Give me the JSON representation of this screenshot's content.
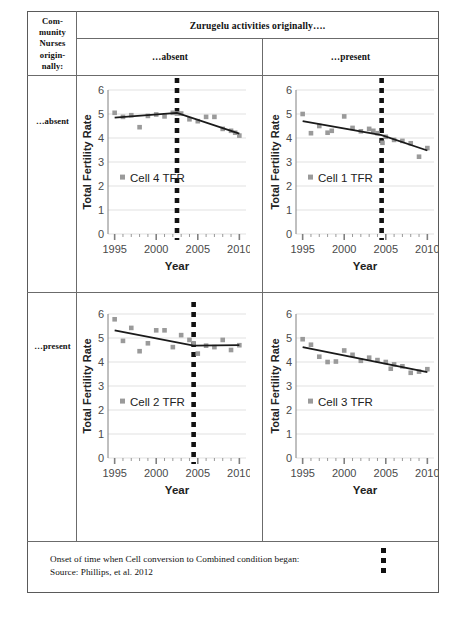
{
  "figure": {
    "corner_label": "Com-\nmunity\nNurses\norigin-\nnally:",
    "column_header": "Zurugelu activities originally….",
    "column_sub_absent": "…absent",
    "column_sub_present": "…present",
    "row_label_absent": "…absent",
    "row_label_present": "…present",
    "footer_legend": "Onset of time when Cell conversion to Combined condition began:",
    "footer_source": "Source: Phillips, et al. 2012",
    "marker_color": "#9a9a9a",
    "trend_color": "#1a1a1a",
    "dash_color": "#111111",
    "grid_color": "#d9d9d9",
    "axis_color": "#808080",
    "border_color": "#5a5a5a"
  },
  "chart_data": [
    {
      "type": "scatter",
      "panel": "top-left",
      "title": "Cell 4 TFR",
      "legend": [
        "Cell 4 TFR"
      ],
      "legend_position": "inside-left",
      "xlabel": "Year",
      "ylabel": "Total Fertility Rate",
      "xlim": [
        1994.2,
        2010.8
      ],
      "ylim": [
        0,
        6
      ],
      "yticks": [
        0,
        1,
        2,
        3,
        4,
        5,
        6
      ],
      "xticks": [
        1995,
        2000,
        2005,
        2010
      ],
      "grid": true,
      "x": [
        1995,
        1996,
        1997,
        1998,
        1999,
        2000,
        2001,
        2002,
        2002.5,
        2003,
        2004,
        2005,
        2006,
        2007,
        2008,
        2009,
        2009.5,
        2010
      ],
      "values": [
        5.05,
        4.88,
        4.95,
        4.45,
        4.92,
        4.98,
        4.9,
        5.05,
        5.02,
        5.02,
        4.78,
        4.7,
        4.88,
        4.88,
        4.38,
        4.3,
        4.22,
        4.1
      ],
      "trend_x": [
        1995,
        2002.5,
        2010
      ],
      "trend_y": [
        4.85,
        5.05,
        4.18
      ],
      "vline_x": 2002.5,
      "vline_label": "Onset of Cell conversion"
    },
    {
      "type": "scatter",
      "panel": "top-right",
      "title": "Cell 1 TFR",
      "legend": [
        "Cell 1 TFR"
      ],
      "legend_position": "inside-left",
      "xlabel": "Year",
      "ylabel": "Total Fertility Rate",
      "xlim": [
        1994.2,
        2010.8
      ],
      "ylim": [
        0,
        6
      ],
      "yticks": [
        0,
        1,
        2,
        3,
        4,
        5,
        6
      ],
      "xticks": [
        1995,
        2000,
        2005,
        2010
      ],
      "grid": true,
      "x": [
        1995,
        1996,
        1997,
        1998,
        1998.5,
        2000,
        2001,
        2002,
        2003,
        2003.5,
        2004,
        2004.6,
        2005,
        2006,
        2007,
        2008,
        2009,
        2010
      ],
      "values": [
        5.0,
        4.2,
        4.5,
        4.22,
        4.3,
        4.9,
        4.42,
        4.28,
        4.38,
        4.3,
        4.2,
        3.8,
        4.05,
        3.92,
        3.88,
        3.78,
        3.22,
        3.58
      ],
      "trend_x": [
        1995,
        2004.5,
        2010
      ],
      "trend_y": [
        4.7,
        4.12,
        3.48
      ],
      "vline_x": 2004.5,
      "vline_label": "Onset of Cell conversion"
    },
    {
      "type": "scatter",
      "panel": "bottom-left",
      "title": "Cell 2 TFR",
      "legend": [
        "Cell 2 TFR"
      ],
      "legend_position": "inside-left",
      "xlabel": "Year",
      "ylabel": "Total Fertility Rate",
      "xlim": [
        1994.2,
        2010.8
      ],
      "ylim": [
        0,
        6
      ],
      "yticks": [
        0,
        1,
        2,
        3,
        4,
        5,
        6
      ],
      "xticks": [
        1995,
        2000,
        2005,
        2010
      ],
      "grid": true,
      "x": [
        1995,
        1996,
        1997,
        1998,
        1999,
        2000,
        2001,
        2002,
        2003,
        2004,
        2004.5,
        2005,
        2006,
        2007,
        2008,
        2009,
        2010
      ],
      "values": [
        5.78,
        4.88,
        5.42,
        4.45,
        4.78,
        5.32,
        5.32,
        4.62,
        5.12,
        4.92,
        4.78,
        4.35,
        4.68,
        4.62,
        4.92,
        4.5,
        4.7
      ],
      "trend_x": [
        1995,
        2004.5,
        2010
      ],
      "trend_y": [
        5.32,
        4.68,
        4.7
      ],
      "vline_x": 2004.5,
      "vline_label": "Onset of Cell conversion"
    },
    {
      "type": "scatter",
      "panel": "bottom-right",
      "title": "Cell 3 TFR",
      "legend": [
        "Cell 3 TFR"
      ],
      "legend_position": "inside-left",
      "xlabel": "Year",
      "ylabel": "Total Fertility Rate",
      "xlim": [
        1994.2,
        2010.8
      ],
      "ylim": [
        0,
        6
      ],
      "yticks": [
        0,
        1,
        2,
        3,
        4,
        5,
        6
      ],
      "xticks": [
        1995,
        2000,
        2005,
        2010
      ],
      "grid": true,
      "x": [
        1995,
        1996,
        1997,
        1998,
        1999,
        2000,
        2001,
        2002,
        2003,
        2004,
        2005,
        2005.6,
        2006,
        2007,
        2008,
        2009,
        2010
      ],
      "values": [
        4.95,
        4.72,
        4.22,
        4.0,
        4.02,
        4.48,
        4.3,
        4.05,
        4.18,
        4.08,
        4.0,
        3.72,
        3.9,
        3.82,
        3.55,
        3.6,
        3.7
      ],
      "trend_x": [
        1995,
        2010
      ],
      "trend_y": [
        4.62,
        3.58
      ],
      "vline_x": null
    }
  ]
}
